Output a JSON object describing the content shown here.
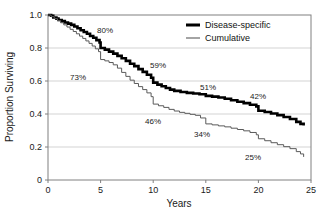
{
  "chart_data": {
    "type": "line",
    "subtype": "kaplan-meier-step",
    "title": "",
    "xlabel": "Years",
    "ylabel": "Proportion Surviving",
    "xlim": [
      0,
      25
    ],
    "ylim": [
      0,
      1.0
    ],
    "xticks": [
      "0",
      "5",
      "10",
      "15",
      "20",
      "25"
    ],
    "xtick_values": [
      0,
      5,
      10,
      15,
      20,
      25
    ],
    "yticks": [
      "0",
      "0.2",
      "0.4",
      "0.6",
      "0.8",
      "1.0"
    ],
    "ytick_values": [
      0,
      0.2,
      0.4,
      0.6,
      0.8,
      1.0
    ],
    "grid": "horizontal",
    "grid_color": "#c8c8c8",
    "frame": true,
    "legend_position": "top-right",
    "series": [
      {
        "name": "Disease-specific",
        "color": "#000000",
        "line_width": 2.6,
        "points": [
          [
            0.0,
            1.0
          ],
          [
            0.3,
            0.995
          ],
          [
            0.5,
            0.985
          ],
          [
            0.8,
            0.978
          ],
          [
            1.0,
            0.97
          ],
          [
            1.3,
            0.963
          ],
          [
            1.6,
            0.955
          ],
          [
            1.9,
            0.948
          ],
          [
            2.2,
            0.94
          ],
          [
            2.5,
            0.93
          ],
          [
            2.8,
            0.92
          ],
          [
            3.1,
            0.908
          ],
          [
            3.4,
            0.897
          ],
          [
            3.7,
            0.886
          ],
          [
            4.0,
            0.873
          ],
          [
            4.3,
            0.862
          ],
          [
            4.6,
            0.848
          ],
          [
            4.9,
            0.833
          ],
          [
            5.0,
            0.8
          ],
          [
            5.4,
            0.79
          ],
          [
            5.8,
            0.778
          ],
          [
            6.2,
            0.766
          ],
          [
            6.6,
            0.752
          ],
          [
            7.0,
            0.738
          ],
          [
            7.4,
            0.722
          ],
          [
            7.8,
            0.705
          ],
          [
            8.2,
            0.69
          ],
          [
            8.6,
            0.672
          ],
          [
            9.0,
            0.655
          ],
          [
            9.4,
            0.638
          ],
          [
            9.8,
            0.62
          ],
          [
            10.0,
            0.59
          ],
          [
            10.4,
            0.578
          ],
          [
            10.8,
            0.568
          ],
          [
            11.2,
            0.558
          ],
          [
            11.6,
            0.548
          ],
          [
            12.0,
            0.54
          ],
          [
            12.6,
            0.533
          ],
          [
            13.2,
            0.528
          ],
          [
            13.8,
            0.524
          ],
          [
            14.4,
            0.52
          ],
          [
            15.0,
            0.51
          ],
          [
            15.6,
            0.505
          ],
          [
            16.2,
            0.5
          ],
          [
            16.8,
            0.492
          ],
          [
            17.4,
            0.483
          ],
          [
            18.0,
            0.474
          ],
          [
            18.6,
            0.466
          ],
          [
            19.2,
            0.456
          ],
          [
            19.8,
            0.446
          ],
          [
            20.0,
            0.42
          ],
          [
            20.6,
            0.412
          ],
          [
            21.2,
            0.403
          ],
          [
            21.8,
            0.393
          ],
          [
            22.4,
            0.382
          ],
          [
            23.0,
            0.37
          ],
          [
            23.6,
            0.352
          ],
          [
            24.0,
            0.34
          ],
          [
            24.3,
            0.33
          ]
        ],
        "milestones": [
          {
            "x": 5,
            "value": 0.8,
            "label": "80%"
          },
          {
            "x": 10,
            "value": 0.59,
            "label": "59%"
          },
          {
            "x": 15,
            "value": 0.51,
            "label": "51%"
          },
          {
            "x": 20,
            "value": 0.42,
            "label": "42%"
          }
        ]
      },
      {
        "name": "Cumulative",
        "color": "#5a5a5a",
        "line_width": 1.0,
        "points": [
          [
            0.0,
            1.0
          ],
          [
            0.3,
            0.99
          ],
          [
            0.6,
            0.978
          ],
          [
            0.9,
            0.966
          ],
          [
            1.2,
            0.953
          ],
          [
            1.5,
            0.94
          ],
          [
            1.8,
            0.927
          ],
          [
            2.1,
            0.913
          ],
          [
            2.4,
            0.9
          ],
          [
            2.7,
            0.886
          ],
          [
            3.0,
            0.872
          ],
          [
            3.3,
            0.858
          ],
          [
            3.6,
            0.843
          ],
          [
            3.9,
            0.828
          ],
          [
            4.2,
            0.812
          ],
          [
            4.5,
            0.795
          ],
          [
            4.8,
            0.778
          ],
          [
            5.0,
            0.73
          ],
          [
            5.4,
            0.722
          ],
          [
            5.8,
            0.712
          ],
          [
            6.2,
            0.698
          ],
          [
            6.6,
            0.678
          ],
          [
            7.0,
            0.652
          ],
          [
            7.4,
            0.628
          ],
          [
            7.8,
            0.605
          ],
          [
            8.2,
            0.585
          ],
          [
            8.6,
            0.566
          ],
          [
            9.0,
            0.548
          ],
          [
            9.4,
            0.528
          ],
          [
            9.8,
            0.505
          ],
          [
            10.0,
            0.46
          ],
          [
            10.5,
            0.45
          ],
          [
            11.0,
            0.44
          ],
          [
            11.5,
            0.428
          ],
          [
            12.0,
            0.418
          ],
          [
            12.5,
            0.41
          ],
          [
            13.0,
            0.404
          ],
          [
            13.5,
            0.398
          ],
          [
            14.0,
            0.392
          ],
          [
            14.5,
            0.376
          ],
          [
            15.0,
            0.34
          ],
          [
            15.6,
            0.334
          ],
          [
            16.2,
            0.328
          ],
          [
            16.8,
            0.322
          ],
          [
            17.4,
            0.314
          ],
          [
            18.0,
            0.306
          ],
          [
            18.6,
            0.298
          ],
          [
            19.2,
            0.288
          ],
          [
            19.8,
            0.274
          ],
          [
            20.0,
            0.25
          ],
          [
            20.6,
            0.238
          ],
          [
            21.2,
            0.226
          ],
          [
            21.8,
            0.214
          ],
          [
            22.4,
            0.202
          ],
          [
            23.0,
            0.19
          ],
          [
            23.6,
            0.172
          ],
          [
            24.0,
            0.158
          ],
          [
            24.3,
            0.14
          ]
        ],
        "milestones": [
          {
            "x": 5,
            "value": 0.73,
            "label": "73%"
          },
          {
            "x": 10,
            "value": 0.46,
            "label": "46%"
          },
          {
            "x": 15,
            "value": 0.34,
            "label": "34%"
          },
          {
            "x": 20,
            "value": 0.25,
            "label": "25%"
          }
        ]
      }
    ],
    "annotations": [
      {
        "label": "80%",
        "px": 105,
        "py": 33
      },
      {
        "label": "73%",
        "px": 78,
        "py": 80
      },
      {
        "label": "59%",
        "px": 158,
        "py": 68
      },
      {
        "label": "51%",
        "px": 208,
        "py": 90
      },
      {
        "label": "46%",
        "px": 153,
        "py": 124
      },
      {
        "label": "42%",
        "px": 258,
        "py": 99
      },
      {
        "label": "34%",
        "px": 202,
        "py": 137
      },
      {
        "label": "25%",
        "px": 253,
        "py": 160
      }
    ]
  },
  "axes": {
    "xlabel": "Years",
    "ylabel": "Proportion Surviving"
  },
  "legend": {
    "items": [
      {
        "label": "Disease-specific",
        "color": "#000000",
        "width": 3.0
      },
      {
        "label": "Cumulative",
        "color": "#5a5a5a",
        "width": 1.1
      }
    ]
  }
}
